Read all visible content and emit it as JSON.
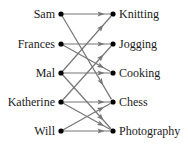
{
  "diagram": {
    "type": "mapping",
    "domain": [
      {
        "id": "sam",
        "label": "Sam",
        "y": 14
      },
      {
        "id": "frances",
        "label": "Frances",
        "y": 44
      },
      {
        "id": "mal",
        "label": "Mal",
        "y": 73
      },
      {
        "id": "katherine",
        "label": "Katherine",
        "y": 102
      },
      {
        "id": "will",
        "label": "Will",
        "y": 131
      }
    ],
    "codomain": [
      {
        "id": "knitting",
        "label": "Knitting",
        "y": 14
      },
      {
        "id": "jogging",
        "label": "Jogging",
        "y": 44
      },
      {
        "id": "cooking",
        "label": "Cooking",
        "y": 73
      },
      {
        "id": "chess",
        "label": "Chess",
        "y": 102
      },
      {
        "id": "photography",
        "label": "Photography",
        "y": 131
      }
    ],
    "edges": [
      {
        "from": "sam",
        "to": "knitting"
      },
      {
        "from": "sam",
        "to": "chess"
      },
      {
        "from": "frances",
        "to": "jogging"
      },
      {
        "from": "frances",
        "to": "cooking"
      },
      {
        "from": "mal",
        "to": "knitting"
      },
      {
        "from": "mal",
        "to": "cooking"
      },
      {
        "from": "mal",
        "to": "photography"
      },
      {
        "from": "katherine",
        "to": "jogging"
      },
      {
        "from": "katherine",
        "to": "chess"
      },
      {
        "from": "katherine",
        "to": "photography"
      },
      {
        "from": "will",
        "to": "chess"
      },
      {
        "from": "will",
        "to": "photography"
      }
    ],
    "colors": {
      "dot": "#000000",
      "edge": "#777777",
      "text": "#1a1a1a"
    }
  }
}
